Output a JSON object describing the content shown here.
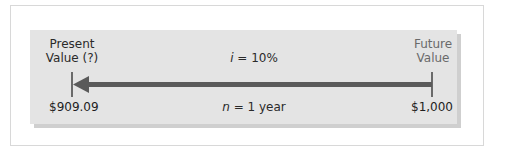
{
  "diagram": {
    "type": "timeline",
    "left_end": {
      "label_line1": "Present",
      "label_line2": "Value (?)",
      "value": "$909.09"
    },
    "right_end": {
      "label_line1": "Future",
      "label_line2": "Value",
      "value": "$1,000"
    },
    "rate": {
      "var": "i",
      "eq": " = 10%"
    },
    "period": {
      "var": "n",
      "eq": " = 1 year"
    },
    "arrow_direction": "right-to-left",
    "colors": {
      "panel": "#e4e4e4",
      "arrow": "#5a5a5a",
      "tick": "#6a6a6a",
      "text": "#2a2a2a",
      "future_text": "#6a6a6a"
    }
  }
}
